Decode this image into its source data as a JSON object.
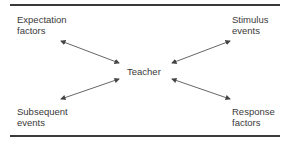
{
  "diagram": {
    "center": "Teacher",
    "nodes": {
      "top_left": [
        "Expectation",
        "factors"
      ],
      "top_right": [
        "Stimulus",
        "events"
      ],
      "bottom_left": [
        "Subsequent",
        "events"
      ],
      "bottom_right": [
        "Response",
        "factors"
      ]
    },
    "arrows": [
      {
        "from": "Teacher",
        "to": "Expectation factors",
        "type": "bidirectional"
      },
      {
        "from": "Teacher",
        "to": "Stimulus events",
        "type": "bidirectional"
      },
      {
        "from": "Teacher",
        "to": "Subsequent events",
        "type": "bidirectional"
      },
      {
        "from": "Teacher",
        "to": "Response factors",
        "type": "bidirectional"
      }
    ]
  }
}
